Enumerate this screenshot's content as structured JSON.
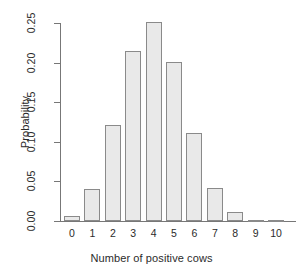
{
  "chart_data": {
    "type": "bar",
    "title": "",
    "xlabel": "Number of positive cows",
    "ylabel": "Probability",
    "categories": [
      "0",
      "1",
      "2",
      "3",
      "4",
      "5",
      "6",
      "7",
      "8",
      "9",
      "10"
    ],
    "values": [
      0.006,
      0.04,
      0.121,
      0.215,
      0.251,
      0.201,
      0.111,
      0.042,
      0.011,
      0.0016,
      0.0001
    ],
    "ylim": [
      0,
      0.25
    ],
    "ytick_labels": [
      "0.00",
      "0.05",
      "0.10",
      "0.15",
      "0.20",
      "0.25"
    ],
    "ytick_values": [
      0.0,
      0.05,
      0.1,
      0.15,
      0.2,
      0.25
    ],
    "grid": false,
    "legend": false,
    "bar_fill": "#e9e9e9",
    "bar_border": "#8a8a8a",
    "axis_color": "#777777"
  }
}
